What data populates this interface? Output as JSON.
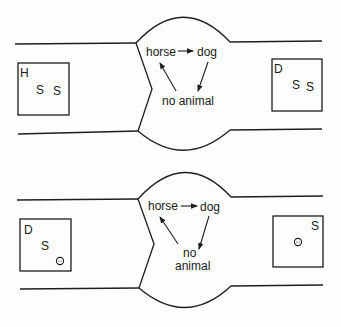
{
  "panels": [
    {
      "name": "top",
      "left_box": {
        "letter": "H",
        "symbols": [
          "S",
          "S"
        ],
        "faces": 0
      },
      "right_box": {
        "letter": "D",
        "symbols": [
          "S",
          "S"
        ],
        "faces": 0
      },
      "states": {
        "horse": "horse",
        "dog": "dog",
        "none_line1": "no animal",
        "none_line2": ""
      },
      "transitions": [
        "horse -> dog",
        "dog -> no animal",
        "no animal -> horse"
      ]
    },
    {
      "name": "bottom",
      "left_box": {
        "letter": "D",
        "symbols": [
          "S"
        ],
        "faces": 1
      },
      "right_box": {
        "letter": "S",
        "symbols": [],
        "faces": 1
      },
      "states": {
        "horse": "horse",
        "dog": "dog",
        "none_line1": "no",
        "none_line2": "animal"
      },
      "transitions": [
        "horse -> dog",
        "dog -> no animal",
        "no animal -> horse"
      ]
    }
  ],
  "icons": {
    "face": "smiley-face-icon"
  }
}
